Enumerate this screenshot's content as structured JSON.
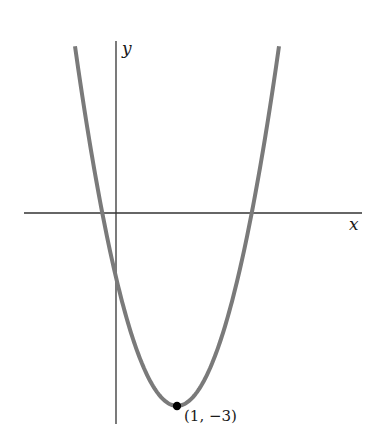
{
  "chart_data": {
    "type": "line",
    "title": "",
    "function": "y = 2(x - 1)^2 - 3",
    "xlabel": "x",
    "ylabel": "y",
    "grid": false,
    "legend": null,
    "xlim": [
      -0.7,
      4.0
    ],
    "ylim": [
      -3.2,
      2.7
    ],
    "series": [
      {
        "name": "parabola",
        "color": "#7a7a7a",
        "x": [
          -0.7,
          -0.5,
          -0.22,
          0,
          0.5,
          1,
          1.5,
          2,
          2.22,
          2.5,
          2.75
        ],
        "y": [
          2.78,
          1.5,
          0,
          -1,
          -2.5,
          -3,
          -2.5,
          -1,
          0,
          1.5,
          3.13
        ]
      }
    ],
    "annotations": [
      {
        "type": "point",
        "x": 1,
        "y": -3,
        "label": "(1, −3)",
        "color": "#000000"
      }
    ]
  },
  "labels": {
    "x_axis": "x",
    "y_axis": "y",
    "vertex": "(1, −3)"
  },
  "colors": {
    "curve": "#7a7a7a",
    "axes": "#333333",
    "point": "#000000"
  }
}
